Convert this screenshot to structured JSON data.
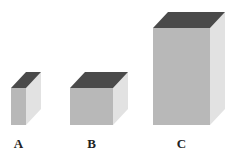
{
  "figure": {
    "boxes": [
      {
        "label": "A",
        "front": {
          "x": 11,
          "y": 88,
          "w": 15,
          "h": 37
        },
        "depth": {
          "dx": 15,
          "dy": -16
        }
      },
      {
        "label": "B",
        "front": {
          "x": 70,
          "y": 88,
          "w": 43,
          "h": 37
        },
        "depth": {
          "dx": 15,
          "dy": -16
        }
      },
      {
        "label": "C",
        "front": {
          "x": 153,
          "y": 28,
          "w": 57,
          "h": 97
        },
        "depth": {
          "dx": 15,
          "dy": -16
        }
      }
    ],
    "colors": {
      "front": "#b8b8b8",
      "side": "#e2e2e2",
      "top": "#4a4a4a"
    }
  }
}
